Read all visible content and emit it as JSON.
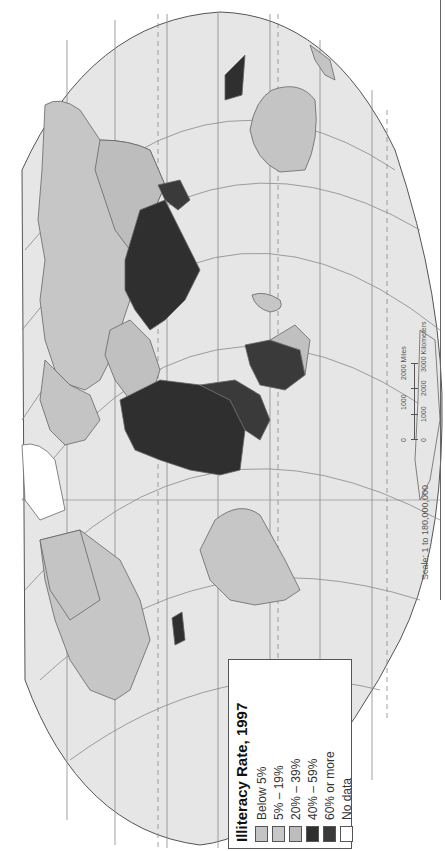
{
  "map": {
    "title": "Illiteracy Rate, 1997",
    "projection": "world map rotated 90° counter-clockwise",
    "colors": {
      "ocean": "#e6e6e6",
      "graticule": "#888888",
      "coastline": "#666666"
    }
  },
  "legend": {
    "title": "Illiteracy Rate, 1997",
    "items": [
      {
        "label": "Below 5%",
        "color": "#c4c4c4"
      },
      {
        "label": "5% – 19%",
        "color": "#c8c8c8"
      },
      {
        "label": "20% – 39%",
        "color": "#bdbdbd"
      },
      {
        "label": "40% – 59%",
        "color": "#2f2f2f"
      },
      {
        "label": "60% or more",
        "color": "#3a3a3a"
      },
      {
        "label": "No data",
        "color": "#ffffff"
      }
    ]
  },
  "scale": {
    "text": "Scale:  1 to 180,000,000",
    "miles": {
      "ticks": [
        "0",
        "1000",
        "2000 Miles"
      ]
    },
    "kilometers": {
      "ticks": [
        "0",
        "1000",
        "2000",
        "3000 Kilometers"
      ]
    }
  }
}
